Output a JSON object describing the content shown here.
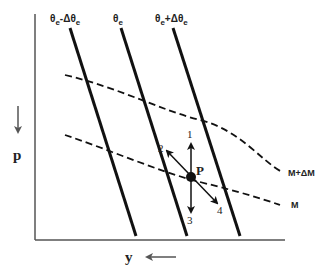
{
  "diagram": {
    "axes": {
      "vertical_label": "p",
      "horizontal_label": "y"
    },
    "solid_lines": [
      {
        "id": "theta_minus",
        "label_main": "θ",
        "label_sub": "e",
        "label_mid": "-Δθ",
        "label_sub2": "e"
      },
      {
        "id": "theta",
        "label_main": "θ",
        "label_sub": "e"
      },
      {
        "id": "theta_plus",
        "label_main": "θ",
        "label_sub": "e",
        "label_mid": "+Δθ",
        "label_sub2": "e"
      }
    ],
    "dashed_curves": [
      {
        "id": "m_plus",
        "label": "M+ΔM"
      },
      {
        "id": "m",
        "label": "M"
      }
    ],
    "point": {
      "label": "P"
    },
    "arrows": [
      {
        "id": "1",
        "label": "1"
      },
      {
        "id": "2",
        "label": "2"
      },
      {
        "id": "3",
        "label": "3"
      },
      {
        "id": "4",
        "label": "4"
      }
    ],
    "colors": {
      "line": "#111111",
      "axis": "#555555",
      "text": "#222222"
    }
  }
}
